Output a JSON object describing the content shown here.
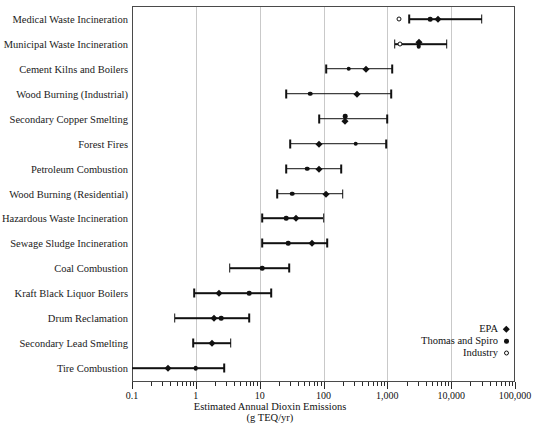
{
  "chart_data": {
    "type": "scatter",
    "title": "",
    "xlabel": "Estimated Annual Dioxin Emissions",
    "xlabel_line2": "(g TEQ/yr)",
    "ylabel": "",
    "xscale": "log",
    "xlim": [
      0.1,
      100000
    ],
    "grid": "vertical-major",
    "legend_position": "inside-bottom-right",
    "tick_labels": [
      "0.1",
      "1",
      "10",
      "100",
      "1,000",
      "10,000",
      "100,000"
    ],
    "tick_values": [
      0.1,
      1,
      10,
      100,
      1000,
      10000,
      100000
    ],
    "legend": [
      {
        "name": "EPA",
        "marker": "diamond"
      },
      {
        "name": "Thomas and Spiro",
        "marker": "filled-circle"
      },
      {
        "name": "Industry",
        "marker": "open-circle"
      }
    ],
    "categories": [
      "Medical Waste Incineration",
      "Municipal Waste Incineration",
      "Cement Kilns and Boilers",
      "Wood Burning (Industrial)",
      "Secondary Copper Smelting",
      "Forest Fires",
      "Petroleum Combustion",
      "Wood Burning (Residential)",
      "Hazardous Waste Incineration",
      "Sewage Sludge Incineration",
      "Coal Combustion",
      "Kraft Black Liquor Boilers",
      "Drum Reclamation",
      "Secondary Lead Smelting",
      "Tire Combustion"
    ],
    "rows": [
      {
        "category": "Medical Waste Incineration",
        "range": [
          2200,
          30000
        ],
        "points": [
          {
            "series": "Industry",
            "marker": "open-circle",
            "value": 1500
          },
          {
            "series": "Thomas and Spiro",
            "marker": "filled-circle",
            "value": 4700
          },
          {
            "series": "EPA",
            "marker": "diamond",
            "value": 6200
          }
        ]
      },
      {
        "category": "Municipal Waste Incineration",
        "range": [
          1300,
          8500
        ],
        "points": [
          {
            "series": "Industry",
            "marker": "open-circle",
            "value": 1600
          },
          {
            "series": "EPA",
            "marker": "diamond",
            "value": 3100
          },
          {
            "series": "Thomas and Spiro",
            "marker": "filled-circle",
            "value": 3100
          }
        ]
      },
      {
        "category": "Cement Kilns and Boilers",
        "range": [
          110,
          1200
        ],
        "points": [
          {
            "series": "Thomas and Spiro",
            "marker": "filled-circle",
            "value": 250
          },
          {
            "series": "EPA",
            "marker": "diamond",
            "value": 460
          }
        ]
      },
      {
        "category": "Wood Burning (Industrial)",
        "range": [
          26,
          1150
        ],
        "points": [
          {
            "series": "Thomas and Spiro",
            "marker": "filled-circle",
            "value": 62
          },
          {
            "series": "EPA",
            "marker": "diamond",
            "value": 340
          }
        ]
      },
      {
        "category": "Secondary Copper Smelting",
        "range": [
          85,
          1000
        ],
        "points": [
          {
            "series": "Thomas and Spiro",
            "marker": "filled-circle",
            "value": 220
          },
          {
            "series": "EPA",
            "marker": "diamond",
            "value": 220
          }
        ]
      },
      {
        "category": "Forest Fires",
        "range": [
          30,
          950
        ],
        "points": [
          {
            "series": "EPA",
            "marker": "diamond",
            "value": 85
          },
          {
            "series": "Thomas and Spiro",
            "marker": "filled-circle",
            "value": 320
          }
        ]
      },
      {
        "category": "Petroleum Combustion",
        "range": [
          26,
          190
        ],
        "points": [
          {
            "series": "Thomas and Spiro",
            "marker": "filled-circle",
            "value": 55
          },
          {
            "series": "EPA",
            "marker": "diamond",
            "value": 85
          }
        ]
      },
      {
        "category": "Wood Burning (Residential)",
        "range": [
          19,
          200
        ],
        "points": [
          {
            "series": "Thomas and Spiro",
            "marker": "filled-circle",
            "value": 32
          },
          {
            "series": "EPA",
            "marker": "diamond",
            "value": 110
          }
        ]
      },
      {
        "category": "Hazardous Waste Incineration",
        "range": [
          11,
          100
        ],
        "points": [
          {
            "series": "Thomas and Spiro",
            "marker": "filled-circle",
            "value": 26
          },
          {
            "series": "EPA",
            "marker": "diamond",
            "value": 37
          }
        ]
      },
      {
        "category": "Sewage Sludge Incineration",
        "range": [
          11,
          115
        ],
        "points": [
          {
            "series": "Thomas and Spiro",
            "marker": "filled-circle",
            "value": 28
          },
          {
            "series": "EPA",
            "marker": "diamond",
            "value": 65
          }
        ]
      },
      {
        "category": "Coal Combustion",
        "range": [
          3.4,
          29
        ],
        "points": [
          {
            "series": "Thomas and Spiro",
            "marker": "filled-circle",
            "value": 11
          }
        ]
      },
      {
        "category": "Kraft Black Liquor Boilers",
        "range": [
          0.95,
          15
        ],
        "points": [
          {
            "series": "EPA",
            "marker": "diamond",
            "value": 2.3
          },
          {
            "series": "Thomas and Spiro",
            "marker": "filled-circle",
            "value": 6.8
          }
        ]
      },
      {
        "category": "Drum Reclamation",
        "range": [
          0.47,
          6.8
        ],
        "points": [
          {
            "series": "EPA",
            "marker": "diamond",
            "value": 1.9
          },
          {
            "series": "Thomas and Spiro",
            "marker": "filled-circle",
            "value": 2.5
          }
        ]
      },
      {
        "category": "Secondary Lead Smelting",
        "range": [
          0.9,
          3.5
        ],
        "points": [
          {
            "series": "EPA",
            "marker": "diamond",
            "value": 1.8
          }
        ]
      },
      {
        "category": "Tire Combustion",
        "range": [
          0.1,
          2.8
        ],
        "points": [
          {
            "series": "EPA",
            "marker": "diamond",
            "value": 0.36
          },
          {
            "series": "Thomas and Spiro",
            "marker": "filled-circle",
            "value": 1.0
          }
        ]
      }
    ]
  }
}
